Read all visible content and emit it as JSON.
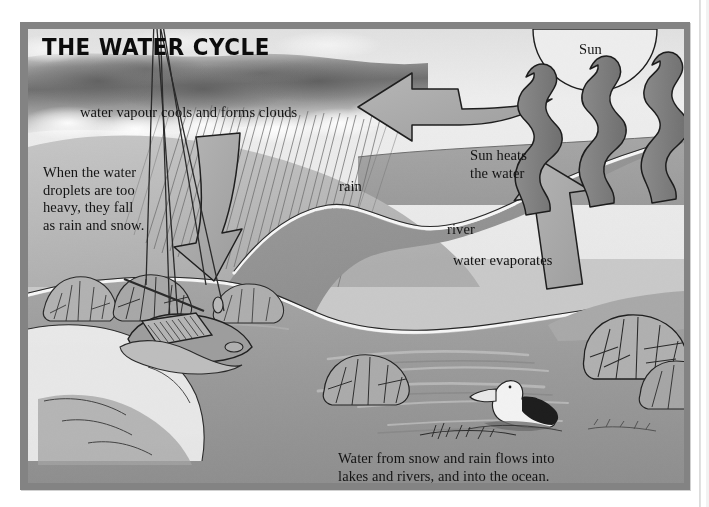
{
  "document": {
    "kind": "illustrated-diagram",
    "title": "THE WATER CYCLE"
  },
  "labels": {
    "title": "THE WATER CYCLE",
    "vapour": "water vapour cools and forms clouds",
    "droplets": "When the water\ndroplets are too\nheavy, they fall\nas rain and snow.",
    "rain": "rain",
    "sun": "Sun",
    "sun_heats": "Sun heats\nthe water",
    "river": "river",
    "evaporates": "water evaporates",
    "caption": "Water from snow and rain flows into\nlakes and rivers, and into the ocean."
  },
  "icons": {
    "sun": "sun-semicircle-icon",
    "cloud": "storm-cloud-icon",
    "rain": "rain-streaks-icon",
    "arrow_down": "curved-down-arrow-icon",
    "arrow_left": "curved-left-arrow-icon",
    "arrow_up": "up-arrow-icon",
    "evaporation": "wavy-vapour-arrow-icon",
    "boat": "sailboat-icon",
    "bird": "pelican-icon",
    "bush": "shrub-icon"
  },
  "colors": {
    "frame": "#838383",
    "page": "#ffffff",
    "sky_light": "#e4e4e4",
    "cloud_dark": "#8d8d8d",
    "land": "#b4b4b4",
    "water_near": "#a2a2a2",
    "water_far": "#8f8f8f",
    "ocean": "#9b9b9b",
    "arrow_fill": "#a8a8a8",
    "vapour_fill": "#8a8a8a",
    "shore_white": "#f4f4f4",
    "ink": "#1a1a1a"
  },
  "scene_elements": [
    {
      "name": "sun",
      "type": "semicircle",
      "note": "half disc at top right of frame"
    },
    {
      "name": "storm-cloud-band",
      "type": "texture",
      "note": "dark cloud band across upper left"
    },
    {
      "name": "rain-streaks",
      "type": "hatching",
      "note": "diagonal rain lines falling from cloud"
    },
    {
      "name": "curved-left-arrow",
      "type": "arrow",
      "note": "evaporated vapour travelling left toward cloud"
    },
    {
      "name": "curved-down-arrow",
      "type": "arrow",
      "note": "rain and snow falling to the land"
    },
    {
      "name": "evaporation-squiggles",
      "type": "arrow",
      "count": 3,
      "note": "wavy arrows rising from ocean under the sun"
    },
    {
      "name": "up-arrow",
      "type": "arrow",
      "note": "broad arrow rising from ocean surface"
    },
    {
      "name": "river",
      "type": "waterway",
      "note": "river winding from upper right down to the ocean"
    },
    {
      "name": "ocean",
      "type": "water",
      "note": "foreground body of water"
    },
    {
      "name": "sailboat",
      "type": "vessel",
      "note": "moored yacht with tall mast, lower left"
    },
    {
      "name": "pelican",
      "type": "bird",
      "note": "pelican floating on the water, lower centre"
    },
    {
      "name": "shrubs",
      "type": "vegetation",
      "count": 6,
      "note": "bushes along both banks"
    }
  ]
}
